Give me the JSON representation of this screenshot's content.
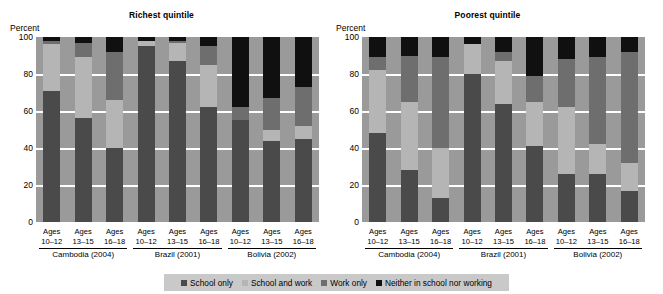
{
  "axis": {
    "ylabel": "Percent",
    "ticks": [
      100,
      80,
      60,
      40,
      20,
      0
    ],
    "ylim": [
      0,
      100
    ]
  },
  "legend": {
    "items": [
      {
        "label": "School only",
        "color": "#4a4a4a"
      },
      {
        "label": "School and work",
        "color": "#b5b5b5"
      },
      {
        "label": "Work only",
        "color": "#6e6e6e"
      },
      {
        "label": "Neither in school nor working",
        "color": "#101010"
      }
    ],
    "background": "#c9c9c9"
  },
  "panels": [
    {
      "title": "Richest quintile",
      "groups": [
        {
          "label": "Cambodia (2004)"
        },
        {
          "label": "Brazil (2001)"
        },
        {
          "label": "Bolivia (2002)"
        }
      ],
      "bars": [
        {
          "age": "Ages\n10–12",
          "group": "Cambodia (2004)",
          "school_only": 71,
          "school_and_work": 25,
          "work_only": 2,
          "neither": 2
        },
        {
          "age": "Ages\n13–15",
          "group": "Cambodia (2004)",
          "school_only": 56,
          "school_and_work": 33,
          "work_only": 8,
          "neither": 3
        },
        {
          "age": "Ages\n16–18",
          "group": "Cambodia (2004)",
          "school_only": 40,
          "school_and_work": 26,
          "work_only": 26,
          "neither": 8
        },
        {
          "age": "Ages\n10–12",
          "group": "Brazil (2001)",
          "school_only": 95,
          "school_and_work": 3,
          "work_only": 0,
          "neither": 2
        },
        {
          "age": "Ages\n13–15",
          "group": "Brazil (2001)",
          "school_only": 87,
          "school_and_work": 10,
          "work_only": 1,
          "neither": 2
        },
        {
          "age": "Ages\n16–18",
          "group": "Brazil (2001)",
          "school_only": 62,
          "school_and_work": 23,
          "work_only": 10,
          "neither": 5
        },
        {
          "age": "Ages\n10–12",
          "group": "Bolivia (2002)",
          "school_only": 55,
          "school_and_work": 0,
          "work_only": 7,
          "neither": 38
        },
        {
          "age": "Ages\n13–15",
          "group": "Bolivia (2002)",
          "school_only": 44,
          "school_and_work": 6,
          "work_only": 17,
          "neither": 33
        },
        {
          "age": "Ages\n16–18",
          "group": "Bolivia (2002)",
          "school_only": 45,
          "school_and_work": 7,
          "work_only": 21,
          "neither": 27
        }
      ]
    },
    {
      "title": "Poorest quintile",
      "groups": [
        {
          "label": "Cambodia (2004)"
        },
        {
          "label": "Brazil (2001)"
        },
        {
          "label": "Bolivia (2002)"
        }
      ],
      "bars": [
        {
          "age": "Ages\n10–12",
          "group": "Cambodia (2004)",
          "school_only": 48,
          "school_and_work": 34,
          "work_only": 7,
          "neither": 11
        },
        {
          "age": "Ages\n13–15",
          "group": "Cambodia (2004)",
          "school_only": 28,
          "school_and_work": 37,
          "work_only": 25,
          "neither": 10
        },
        {
          "age": "Ages\n16–18",
          "group": "Cambodia (2004)",
          "school_only": 13,
          "school_and_work": 27,
          "work_only": 49,
          "neither": 11
        },
        {
          "age": "Ages\n10–12",
          "group": "Brazil (2001)",
          "school_only": 80,
          "school_and_work": 16,
          "work_only": 0,
          "neither": 4
        },
        {
          "age": "Ages\n13–15",
          "group": "Brazil (2001)",
          "school_only": 64,
          "school_and_work": 23,
          "work_only": 5,
          "neither": 8
        },
        {
          "age": "Ages\n16–18",
          "group": "Brazil (2001)",
          "school_only": 41,
          "school_and_work": 24,
          "work_only": 14,
          "neither": 21
        },
        {
          "age": "Ages\n10–12",
          "group": "Bolivia (2002)",
          "school_only": 26,
          "school_and_work": 36,
          "work_only": 26,
          "neither": 12
        },
        {
          "age": "Ages\n13–15",
          "group": "Bolivia (2002)",
          "school_only": 26,
          "school_and_work": 16,
          "work_only": 47,
          "neither": 11
        },
        {
          "age": "Ages\n16–18",
          "group": "Bolivia (2002)",
          "school_only": 17,
          "school_and_work": 15,
          "work_only": 60,
          "neither": 8
        }
      ]
    }
  ],
  "chart_data": {
    "type": "bar",
    "subtitle": "",
    "xlabel": "",
    "ylabel": "Percent",
    "ylim": [
      0,
      100
    ],
    "grid": true,
    "stacked": true,
    "stacked_total": 100,
    "legend_position": "bottom",
    "yticks": [
      0,
      20,
      40,
      60,
      80,
      100
    ],
    "series": [
      {
        "name": "School only",
        "color": "#4a4a4a"
      },
      {
        "name": "School and work",
        "color": "#b5b5b5"
      },
      {
        "name": "Work only",
        "color": "#6e6e6e"
      },
      {
        "name": "Neither in school nor working",
        "color": "#101010"
      }
    ],
    "panels": [
      {
        "title": "Richest quintile",
        "categories": [
          "Cambodia (2004) Ages 10-12",
          "Cambodia (2004) Ages 13-15",
          "Cambodia (2004) Ages 16-18",
          "Brazil (2001) Ages 10-12",
          "Brazil (2001) Ages 13-15",
          "Brazil (2001) Ages 16-18",
          "Bolivia (2002) Ages 10-12",
          "Bolivia (2002) Ages 13-15",
          "Bolivia (2002) Ages 16-18"
        ],
        "values": {
          "School only": [
            71,
            56,
            40,
            95,
            87,
            62,
            55,
            44,
            45
          ],
          "School and work": [
            25,
            33,
            26,
            3,
            10,
            23,
            0,
            6,
            7
          ],
          "Work only": [
            2,
            8,
            26,
            0,
            1,
            10,
            7,
            17,
            21
          ],
          "Neither in school nor working": [
            2,
            3,
            8,
            2,
            2,
            5,
            38,
            33,
            27
          ]
        }
      },
      {
        "title": "Poorest quintile",
        "categories": [
          "Cambodia (2004) Ages 10-12",
          "Cambodia (2004) Ages 13-15",
          "Cambodia (2004) Ages 16-18",
          "Brazil (2001) Ages 10-12",
          "Brazil (2001) Ages 13-15",
          "Brazil (2001) Ages 16-18",
          "Bolivia (2002) Ages 10-12",
          "Bolivia (2002) Ages 13-15",
          "Bolivia (2002) Ages 16-18"
        ],
        "values": {
          "School only": [
            48,
            28,
            13,
            80,
            64,
            41,
            26,
            26,
            17
          ],
          "School and work": [
            34,
            37,
            27,
            16,
            23,
            24,
            36,
            16,
            15
          ],
          "Work only": [
            7,
            25,
            49,
            0,
            5,
            14,
            26,
            47,
            60
          ],
          "Neither in school nor working": [
            11,
            10,
            11,
            4,
            8,
            21,
            12,
            11,
            8
          ]
        }
      }
    ]
  }
}
